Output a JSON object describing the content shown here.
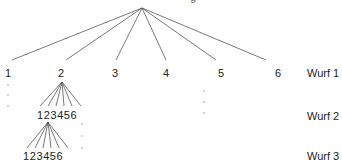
{
  "diagram": {
    "top_label_clipped": "g",
    "level1": {
      "nodes": [
        "1",
        "2",
        "3",
        "4",
        "5",
        "6"
      ],
      "label": "Wurf 1"
    },
    "level2": {
      "nodes": "123456",
      "label": "Wurf 2"
    },
    "level3": {
      "nodes": "123456",
      "label": "Wurf 3"
    },
    "line_color": "#555555",
    "text_color": "#222222"
  }
}
